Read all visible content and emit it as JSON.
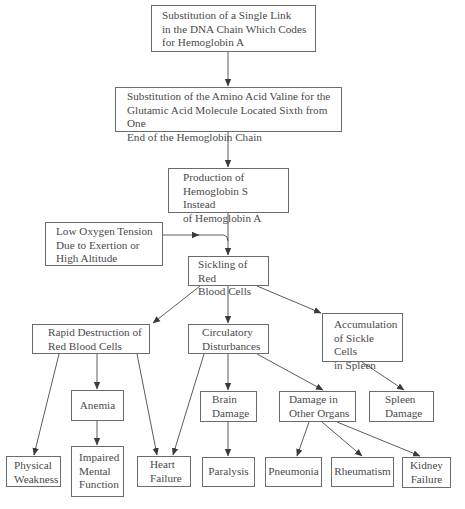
{
  "diagram": {
    "type": "flowchart",
    "title": "",
    "colors": {
      "border": "#6b6b6b",
      "text": "#4a4a4a",
      "arrow": "#4a4a4a",
      "background": "#ffffff"
    },
    "nodes": {
      "dna_substitution": {
        "label": "Substitution of a Single Link\nin the DNA Chain Which Codes\nfor Hemoglobin A"
      },
      "amino_substitution": {
        "label": "Substitution of the Amino Acid Valine for the\nGlutamic Acid Molecule Located Sixth from One\nEnd of the Hemoglobin Chain"
      },
      "hemoglobin_s": {
        "label": "Production of\nHemoglobin S Instead\nof Hemoglobin A"
      },
      "low_oxygen": {
        "label": "Low Oxygen Tension\nDue to Exertion or\nHigh Altitude"
      },
      "sickling": {
        "label": "Sickling of Red\nBlood Cells"
      },
      "rapid_destruction": {
        "label": "Rapid Destruction of\nRed Blood Cells"
      },
      "circulatory": {
        "label": "Circulatory\nDisturbances"
      },
      "accumulation": {
        "label": "Accumulation\nof Sickle Cells\nin Spleen"
      },
      "anemia": {
        "label": "Anemia"
      },
      "brain_damage": {
        "label": "Brain\nDamage"
      },
      "other_organs": {
        "label": "Damage in\nOther Organs"
      },
      "spleen_damage": {
        "label": "Spleen\nDamage"
      },
      "physical_weakness": {
        "label": "Physical\nWeakness"
      },
      "impaired_mental": {
        "label": "Impaired\nMental\nFunction"
      },
      "heart_failure": {
        "label": "Heart\nFailure"
      },
      "paralysis": {
        "label": "Paralysis"
      },
      "pneumonia": {
        "label": "Pneumonia"
      },
      "rheumatism": {
        "label": "Rheumatism"
      },
      "kidney_failure": {
        "label": "Kidney\nFailure"
      }
    },
    "edges": [
      [
        "dna_substitution",
        "amino_substitution"
      ],
      [
        "amino_substitution",
        "hemoglobin_s"
      ],
      [
        "hemoglobin_s",
        "sickling"
      ],
      [
        "low_oxygen",
        "sickling"
      ],
      [
        "sickling",
        "rapid_destruction"
      ],
      [
        "sickling",
        "circulatory"
      ],
      [
        "sickling",
        "accumulation"
      ],
      [
        "rapid_destruction",
        "physical_weakness"
      ],
      [
        "rapid_destruction",
        "anemia"
      ],
      [
        "rapid_destruction",
        "heart_failure"
      ],
      [
        "anemia",
        "impaired_mental"
      ],
      [
        "circulatory",
        "heart_failure"
      ],
      [
        "circulatory",
        "brain_damage"
      ],
      [
        "circulatory",
        "other_organs"
      ],
      [
        "brain_damage",
        "paralysis"
      ],
      [
        "other_organs",
        "pneumonia"
      ],
      [
        "other_organs",
        "rheumatism"
      ],
      [
        "other_organs",
        "kidney_failure"
      ],
      [
        "accumulation",
        "spleen_damage"
      ]
    ]
  }
}
